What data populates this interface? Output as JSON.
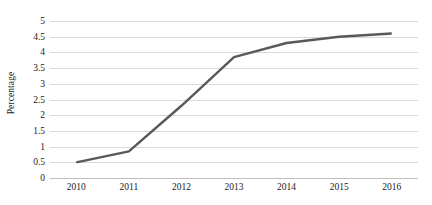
{
  "chart_data": {
    "type": "line",
    "title": "",
    "subtitle": "",
    "xlabel": "",
    "ylabel": "Percentage",
    "categories": [
      "2010",
      "2011",
      "2012",
      "2013",
      "2014",
      "2015",
      "2016"
    ],
    "values": [
      0.5,
      0.85,
      2.3,
      3.85,
      4.3,
      4.5,
      4.6
    ],
    "series": [
      {
        "name": "Percentage",
        "values": [
          0.5,
          0.85,
          2.3,
          3.85,
          4.3,
          4.5,
          4.6
        ]
      }
    ],
    "ylim": [
      0,
      5
    ],
    "xlim": [
      "2010",
      "2016"
    ],
    "y_ticks": [
      0,
      0.5,
      1,
      1.5,
      2,
      2.5,
      3,
      3.5,
      4,
      4.5,
      5
    ],
    "y_tick_labels": [
      "0",
      "0.5",
      "1",
      "1.5",
      "2",
      "2.5",
      "3",
      "3.5",
      "4",
      "4.5",
      "5"
    ],
    "x_tick_labels": [
      "2010",
      "2011",
      "2012",
      "2013",
      "2014",
      "2015",
      "2016"
    ],
    "grid": "horizontal",
    "legend": "none",
    "markers": "none",
    "line_color": "#595959",
    "gridline_color": "#d9d9d9",
    "axis_color": "#bfbfbf",
    "background_color": "#ffffff",
    "text_color": "#1a1a1a",
    "annotations": []
  }
}
